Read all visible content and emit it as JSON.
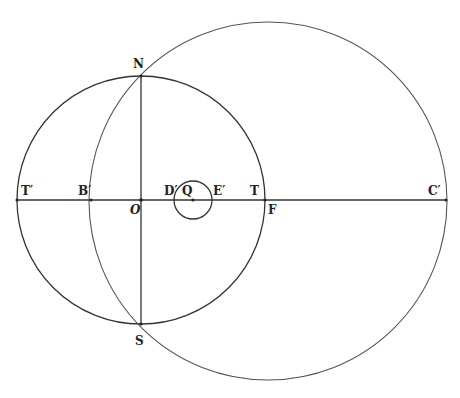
{
  "figure": {
    "type": "geometric construction",
    "colors": {
      "stroke": "#333333",
      "background": "#ffffff"
    },
    "circles": [
      {
        "name": "left-circle",
        "cx": 141,
        "cy": 200,
        "r": 124
      },
      {
        "name": "large-circle",
        "cx": 268,
        "cy": 201,
        "r": 179
      },
      {
        "name": "small-circle",
        "cx": 193,
        "cy": 200,
        "r": 19
      }
    ],
    "lines": [
      {
        "name": "horizontal-axis",
        "x1": 17,
        "y1": 200,
        "x2": 447,
        "y2": 200
      },
      {
        "name": "vertical-diameter-NS",
        "x1": 141,
        "y1": 76,
        "x2": 141,
        "y2": 324
      }
    ],
    "labels": {
      "N": "N",
      "S": "S",
      "T_prime": "T′",
      "B_prime": "B′",
      "O": "O",
      "D_prime": "D′",
      "Q": "Q",
      "E_prime": "E′",
      "T": "T",
      "F": "F",
      "C_prime": "C′"
    }
  }
}
